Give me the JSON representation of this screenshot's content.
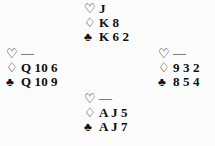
{
  "diagram": {
    "type": "bridge-hand-diagram",
    "layout": "compass-cross",
    "void_marker": "—",
    "suits": {
      "heart": {
        "name": "hearts",
        "glyph": "♡",
        "style": "hollow",
        "color": "#0d0d0d"
      },
      "diamond": {
        "name": "diamonds",
        "glyph": "♢",
        "style": "hollow",
        "color": "#0d0d0d"
      },
      "club": {
        "name": "clubs",
        "glyph": "♣",
        "style": "solid",
        "color": "#0d0d0d"
      }
    },
    "hands": {
      "north": {
        "position": "north",
        "hearts": "J",
        "diamonds": "K 8",
        "clubs": "K 6 2"
      },
      "west": {
        "position": "west",
        "hearts": "—",
        "diamonds": "Q 10 6",
        "clubs": "Q 10 9"
      },
      "east": {
        "position": "east",
        "hearts": "—",
        "diamonds": "9 3 2",
        "clubs": "8 5 4"
      },
      "south": {
        "position": "south",
        "hearts": "—",
        "diamonds": "A J 5",
        "clubs": "A J 7"
      }
    }
  }
}
